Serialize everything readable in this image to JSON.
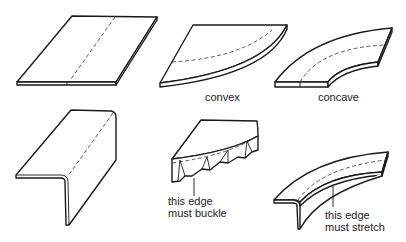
{
  "figure": {
    "panels": [
      {
        "id": "flat-plate",
        "label": ""
      },
      {
        "id": "convex-plate",
        "label": "convex"
      },
      {
        "id": "concave-plate",
        "label": "concave"
      },
      {
        "id": "straight-angle",
        "label": ""
      },
      {
        "id": "convex-flange",
        "annotation_line1": "this edge",
        "annotation_line2": "must buckle"
      },
      {
        "id": "concave-flange",
        "annotation_line1": "this edge",
        "annotation_line2": "must stretch"
      }
    ]
  },
  "colors": {
    "line": "#1a1a1a",
    "background": "#ffffff",
    "text": "#222222"
  }
}
